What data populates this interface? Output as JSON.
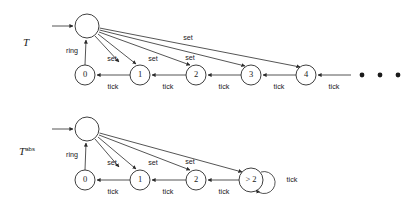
{
  "figure": {
    "automata": [
      {
        "id": "concrete",
        "name": "T",
        "name_sup": "",
        "initial_state": "",
        "states": [
          {
            "id": "top",
            "label": ""
          },
          {
            "id": "s0",
            "label": "0"
          },
          {
            "id": "s1",
            "label": "1"
          },
          {
            "id": "s2",
            "label": "2"
          },
          {
            "id": "s3",
            "label": "3"
          },
          {
            "id": "s4",
            "label": "4"
          }
        ],
        "transitions": [
          {
            "from": "s0",
            "to": "top",
            "label": "ring"
          },
          {
            "from": "top",
            "to": "s0",
            "label": "set"
          },
          {
            "from": "top",
            "to": "s1",
            "label": "set"
          },
          {
            "from": "top",
            "to": "s2",
            "label": "set"
          },
          {
            "from": "top",
            "to": "s3",
            "label": "set"
          },
          {
            "from": "top",
            "to": "s4",
            "label": "set"
          },
          {
            "from": "s1",
            "to": "s0",
            "label": "tick"
          },
          {
            "from": "s2",
            "to": "s1",
            "label": "tick"
          },
          {
            "from": "s3",
            "to": "s2",
            "label": "tick"
          },
          {
            "from": "s4",
            "to": "s3",
            "label": "tick"
          },
          {
            "from": "more",
            "to": "s4",
            "label": "tick"
          }
        ],
        "continuation": "• • •"
      },
      {
        "id": "abstract",
        "name": "T",
        "name_sup": "abs",
        "initial_state": "",
        "states": [
          {
            "id": "top",
            "label": ""
          },
          {
            "id": "s0",
            "label": "0"
          },
          {
            "id": "s1",
            "label": "1"
          },
          {
            "id": "s2",
            "label": "2"
          },
          {
            "id": "sgt2",
            "label": "> 2"
          }
        ],
        "transitions": [
          {
            "from": "s0",
            "to": "top",
            "label": "ring"
          },
          {
            "from": "top",
            "to": "s0",
            "label": "set"
          },
          {
            "from": "top",
            "to": "s1",
            "label": "set"
          },
          {
            "from": "top",
            "to": "s2",
            "label": "set"
          },
          {
            "from": "top",
            "to": "sgt2",
            "label": "set"
          },
          {
            "from": "s1",
            "to": "s0",
            "label": "tick"
          },
          {
            "from": "s2",
            "to": "s1",
            "label": "tick"
          },
          {
            "from": "sgt2",
            "to": "s2",
            "label": "tick"
          },
          {
            "from": "sgt2",
            "to": "sgt2",
            "label": "tick"
          }
        ],
        "continuation": ""
      }
    ],
    "labels": {
      "set": "set",
      "tick": "tick",
      "ring": "ring",
      "state_0": "0",
      "state_1": "1",
      "state_2": "2",
      "state_3": "3",
      "state_4": "4",
      "state_gt2": "> 2",
      "ellipsis": "• • •",
      "name_t": "T",
      "name_t_abs_sup": "abs"
    },
    "colors": {
      "stroke": "#2a2a2a",
      "text": "#1a1a1a",
      "background": "#ffffff"
    }
  }
}
